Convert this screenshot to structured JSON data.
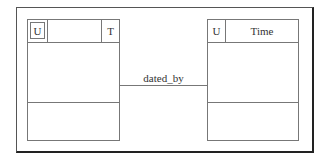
{
  "diagram": {
    "entities": [
      {
        "id": "left",
        "key_marker": "U",
        "type_marker": "T",
        "name": ""
      },
      {
        "id": "right",
        "key_marker": "U",
        "name": "Time"
      }
    ],
    "relationship": {
      "label": "dated_by",
      "from": "left",
      "to": "right"
    }
  }
}
